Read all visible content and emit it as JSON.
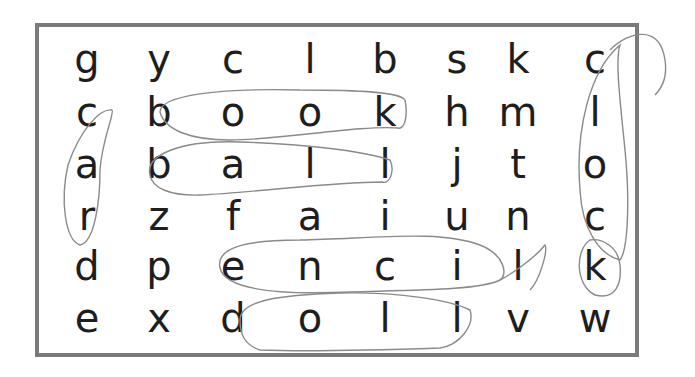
{
  "puzzle": {
    "type": "word-search",
    "rows": [
      [
        "g",
        "y",
        "c",
        "l",
        "b",
        "s",
        "k",
        "c"
      ],
      [
        "c",
        "b",
        "o",
        "o",
        "k",
        "h",
        "m",
        "l"
      ],
      [
        "a",
        "b",
        "a",
        "l",
        "l",
        "j",
        "t",
        "o"
      ],
      [
        "r",
        "z",
        "f",
        "a",
        "i",
        "u",
        "n",
        "c"
      ],
      [
        "d",
        "p",
        "e",
        "n",
        "c",
        "i",
        "l",
        "k"
      ],
      [
        "e",
        "x",
        "d",
        "o",
        "l",
        "l",
        "v",
        "w"
      ]
    ],
    "circled_words": [
      "book",
      "ball",
      "pencil",
      "doll",
      "car",
      "clock"
    ],
    "colors": {
      "border": "#7a7a7a",
      "letters": "#1e1e1e",
      "pencil_marks": "#8a8a8a"
    }
  }
}
